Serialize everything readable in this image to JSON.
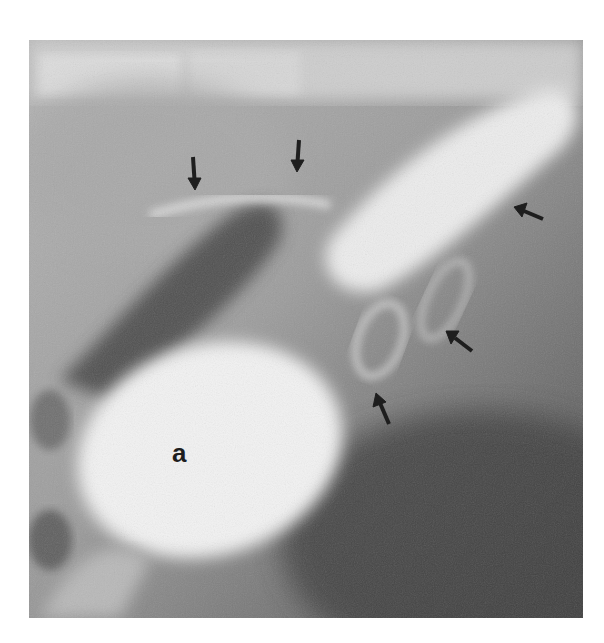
{
  "figure": {
    "type": "radiograph",
    "modality": "contrast fluoroscopy (grayscale)",
    "labels": [
      {
        "id": "a",
        "text": "a",
        "x": 182,
        "y": 455
      }
    ],
    "arrows": [
      {
        "id": "arrow-1",
        "direction": "down",
        "tail": [
          193,
          157
        ],
        "tip": [
          195,
          188
        ]
      },
      {
        "id": "arrow-2",
        "direction": "down",
        "tail": [
          299,
          140
        ],
        "tip": [
          297,
          170
        ]
      },
      {
        "id": "arrow-3",
        "direction": "up-left",
        "tail": [
          543,
          219
        ],
        "tip": [
          516,
          208
        ]
      },
      {
        "id": "arrow-4",
        "direction": "up-left",
        "tail": [
          472,
          351
        ],
        "tip": [
          448,
          333
        ]
      },
      {
        "id": "arrow-5",
        "direction": "up-left",
        "tail": [
          389,
          424
        ],
        "tip": [
          377,
          395
        ]
      }
    ],
    "colors": {
      "background": "#ffffff",
      "arrow": "#1e1e1e",
      "contrast_bright": "#f2f2f2",
      "soft_tissue": "#9a9a9a",
      "dark_lumen": "#4a4a4a"
    }
  }
}
